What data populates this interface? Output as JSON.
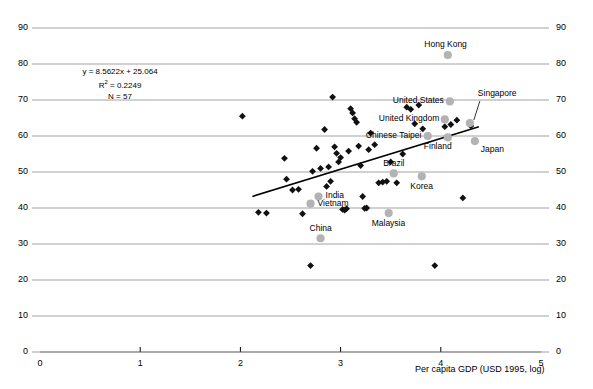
{
  "chart_data": {
    "type": "scatter",
    "title": "",
    "xlabel": "Per capita GDP (USD 1995, log)",
    "ylabel": "",
    "xlim": [
      0,
      5
    ],
    "ylim": [
      0,
      90
    ],
    "xticks": [
      "0",
      "1",
      "2",
      "3",
      "4",
      "5"
    ],
    "yticks": [
      "0",
      "10",
      "20",
      "30",
      "40",
      "50",
      "60",
      "70",
      "80",
      "90"
    ],
    "yticks_right": [
      "0",
      "10",
      "20",
      "30",
      "40",
      "50",
      "60",
      "70",
      "80",
      "90"
    ],
    "grid": true,
    "legend": "none",
    "annotation": {
      "equation": "y = 8.5622x + 25.064",
      "r_squared_prefix": "R",
      "r_squared_sup": "2",
      "r_squared_value": " = 0.2249",
      "n": "N = 57"
    },
    "trendline": {
      "slope": 8.5622,
      "intercept": 25.064,
      "x_start": 2.12,
      "x_end": 4.38,
      "color": "#000000"
    },
    "series": [
      {
        "name": "Countries (unlabeled)",
        "marker": "diamond",
        "color": "#111111",
        "points": [
          [
            2.02,
            65.5
          ],
          [
            2.18,
            38.8
          ],
          [
            2.26,
            38.6
          ],
          [
            2.44,
            53.8
          ],
          [
            2.46,
            48.0
          ],
          [
            2.52,
            45.0
          ],
          [
            2.58,
            45.2
          ],
          [
            2.62,
            38.4
          ],
          [
            2.7,
            24.0
          ],
          [
            2.72,
            50.2
          ],
          [
            2.76,
            56.6
          ],
          [
            2.8,
            51.0
          ],
          [
            2.84,
            61.8
          ],
          [
            2.86,
            46.0
          ],
          [
            2.88,
            51.4
          ],
          [
            2.9,
            47.4
          ],
          [
            2.92,
            70.8
          ],
          [
            2.94,
            57.0
          ],
          [
            2.96,
            55.2
          ],
          [
            2.98,
            52.8
          ],
          [
            3.0,
            54.0
          ],
          [
            3.02,
            39.6
          ],
          [
            3.04,
            39.4
          ],
          [
            3.06,
            39.8
          ],
          [
            3.08,
            55.8
          ],
          [
            3.1,
            67.6
          ],
          [
            3.12,
            66.4
          ],
          [
            3.14,
            64.8
          ],
          [
            3.16,
            63.8
          ],
          [
            3.18,
            57.2
          ],
          [
            3.2,
            51.8
          ],
          [
            3.22,
            43.2
          ],
          [
            3.24,
            39.9
          ],
          [
            3.26,
            40.0
          ],
          [
            3.28,
            56.2
          ],
          [
            3.3,
            60.8
          ],
          [
            3.34,
            57.6
          ],
          [
            3.38,
            47.0
          ],
          [
            3.42,
            47.2
          ],
          [
            3.46,
            47.4
          ],
          [
            3.5,
            52.8
          ],
          [
            3.56,
            47.0
          ],
          [
            3.62,
            55.0
          ],
          [
            3.66,
            68.0
          ],
          [
            3.7,
            67.4
          ],
          [
            3.74,
            63.4
          ],
          [
            3.78,
            68.6
          ],
          [
            3.82,
            62.0
          ],
          [
            3.94,
            24.0
          ],
          [
            4.04,
            62.6
          ],
          [
            4.1,
            63.2
          ],
          [
            4.16,
            64.4
          ],
          [
            4.22,
            42.8
          ],
          [
            4.3,
            62.8
          ]
        ]
      },
      {
        "name": "Highlighted economies",
        "marker": "circle",
        "color": "#b3b3b3",
        "points": [
          {
            "label": "Hong Kong",
            "x": 4.07,
            "y": 82.5,
            "label_pos": "above-left"
          },
          {
            "label": "United States",
            "x": 4.09,
            "y": 69.6,
            "label_pos": "left"
          },
          {
            "label": "Singapore",
            "x": 4.29,
            "y": 63.6,
            "label_pos": "callout"
          },
          {
            "label": "United Kingdom",
            "x": 4.04,
            "y": 64.6,
            "label_pos": "left"
          },
          {
            "label": "Chinese Taipei",
            "x": 3.87,
            "y": 60.0,
            "label_pos": "left"
          },
          {
            "label": "Finland",
            "x": 4.07,
            "y": 59.6,
            "label_pos": "below-left"
          },
          {
            "label": "Japan",
            "x": 4.34,
            "y": 58.6,
            "label_pos": "below-right"
          },
          {
            "label": "Brazil",
            "x": 3.53,
            "y": 49.6,
            "label_pos": "above"
          },
          {
            "label": "Korea",
            "x": 3.81,
            "y": 48.8,
            "label_pos": "below"
          },
          {
            "label": "India",
            "x": 2.78,
            "y": 43.2,
            "label_pos": "right"
          },
          {
            "label": "Vietnam",
            "x": 2.7,
            "y": 41.2,
            "label_pos": "right"
          },
          {
            "label": "Malaysia",
            "x": 3.48,
            "y": 38.6,
            "label_pos": "below"
          },
          {
            "label": "China",
            "x": 2.8,
            "y": 31.6,
            "label_pos": "above"
          }
        ]
      }
    ]
  },
  "labels": {
    "hong_kong": "Hong Kong",
    "united_states": "United States",
    "singapore": "Singapore",
    "united_kingdom": "United Kingdom",
    "chinese_taipei": "Chinese Taipei",
    "finland": "Finland",
    "japan": "Japan",
    "brazil": "Brazil",
    "korea": "Korea",
    "india": "India",
    "vietnam": "Vietnam",
    "malaysia": "Malaysia",
    "china": "China"
  },
  "axes": {
    "x_title": "Per capita GDP (USD 1995, log)"
  },
  "annotation_text": {
    "line1": "y = 8.5622x + 25.064",
    "line2_pre": "R",
    "line2_sup": "2",
    "line2_post": " = 0.2249",
    "line3": "N = 57"
  },
  "colors": {
    "marker_dark": "#111111",
    "marker_highlight": "#b3b3b3",
    "gridline": "#8c8c8c",
    "axis": "#000000"
  }
}
